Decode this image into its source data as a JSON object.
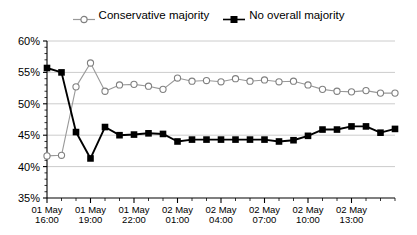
{
  "legend": {
    "position": "top-center",
    "entries": [
      {
        "label": "Conservative majority",
        "marker": "open-circle-icon",
        "color": "#999999"
      },
      {
        "label": "No overall majority",
        "marker": "filled-square-icon",
        "color": "#000000"
      }
    ]
  },
  "chart_data": {
    "type": "line",
    "title": "",
    "subtitle": "",
    "xlabel": "",
    "ylabel": "",
    "grid": true,
    "ylim": [
      35,
      60
    ],
    "ytick_step": 5,
    "ytick_labels": [
      "35%",
      "40%",
      "45%",
      "50%",
      "55%",
      "60%"
    ],
    "ytick_values": [
      35,
      40,
      45,
      50,
      55,
      60
    ],
    "xtick_labels": [
      "01 May\n16:00",
      "01 May\n19:00",
      "01 May\n22:00",
      "02 May\n01:00",
      "02 May\n04:00",
      "02 May\n07:00",
      "02 May\n10:00",
      "02 May\n13:00"
    ],
    "xtick_label_lines": [
      [
        "01 May",
        "16:00"
      ],
      [
        "01 May",
        "19:00"
      ],
      [
        "01 May",
        "22:00"
      ],
      [
        "02 May",
        "01:00"
      ],
      [
        "02 May",
        "04:00"
      ],
      [
        "02 May",
        "07:00"
      ],
      [
        "02 May",
        "10:00"
      ],
      [
        "02 May",
        "13:00"
      ]
    ],
    "xtick_indices": [
      0,
      3,
      6,
      9,
      12,
      15,
      18,
      21
    ],
    "x": [
      "01 May 16:00",
      "01 May 17:00",
      "01 May 18:00",
      "01 May 19:00",
      "01 May 20:00",
      "01 May 21:00",
      "01 May 22:00",
      "01 May 23:00",
      "02 May 00:00",
      "02 May 01:00",
      "02 May 02:00",
      "02 May 03:00",
      "02 May 04:00",
      "02 May 05:00",
      "02 May 06:00",
      "02 May 07:00",
      "02 May 08:00",
      "02 May 09:00",
      "02 May 10:00",
      "02 May 11:00",
      "02 May 12:00",
      "02 May 13:00",
      "02 May 14:00",
      "02 May 15:00",
      "02 May 16:00"
    ],
    "series": [
      {
        "name": "Conservative majority",
        "marker": "open-circle",
        "color": "#999999",
        "values": [
          41.7,
          41.8,
          52.7,
          56.5,
          52.0,
          53.0,
          53.1,
          52.8,
          52.3,
          54.1,
          53.6,
          53.7,
          53.5,
          54.0,
          53.6,
          53.8,
          53.5,
          53.6,
          53.0,
          52.3,
          52.0,
          51.9,
          52.1,
          51.7,
          51.7
        ]
      },
      {
        "name": "No overall majority",
        "marker": "filled-square",
        "color": "#000000",
        "values": [
          55.7,
          55.0,
          45.5,
          41.3,
          46.3,
          45.0,
          45.1,
          45.3,
          45.2,
          44.0,
          44.3,
          44.3,
          44.3,
          44.3,
          44.3,
          44.3,
          44.0,
          44.2,
          44.9,
          45.9,
          45.9,
          46.4,
          46.4,
          45.4,
          46.0
        ]
      }
    ]
  }
}
